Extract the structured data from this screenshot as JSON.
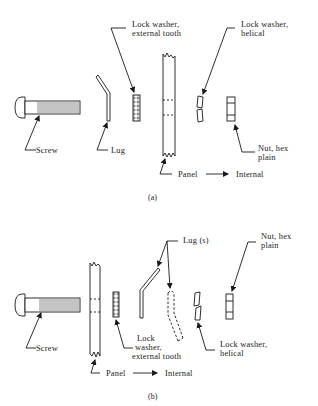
{
  "figure": {
    "panel_a": {
      "caption": "(a)",
      "labels": {
        "screw": "Screw",
        "lug": "Lug",
        "lock_washer_external_line1": "Lock washer,",
        "lock_washer_external_line2": "external tooth",
        "lock_washer_helical_line1": "Lock washer,",
        "lock_washer_helical_line2": "helical",
        "nut_line1": "Nut, hex",
        "nut_line2": "plain",
        "panel": "Panel",
        "internal": "Internal"
      }
    },
    "panel_b": {
      "caption": "(b)",
      "labels": {
        "screw": "Screw",
        "lugs": "Lug (s)",
        "nut_line1": "Nut, hex",
        "nut_line2": "plain",
        "lock_washer_external_line1": "Lock",
        "lock_washer_external_line2": "washer,",
        "lock_washer_external_line3": "external tooth",
        "lock_washer_helical_line1": "Lock washer,",
        "lock_washer_helical_line2": "helical",
        "panel": "Panel",
        "internal": "Internal"
      }
    },
    "colors": {
      "ink": "#1a1a1a",
      "background": "#ffffff"
    }
  }
}
